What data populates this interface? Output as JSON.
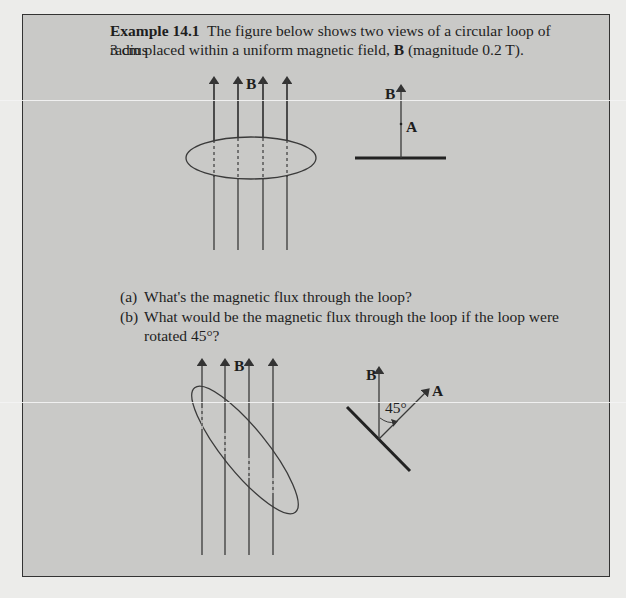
{
  "example": {
    "label": "Example 14.1",
    "intro_line1": "The figure below shows two views of a circular loop of radius",
    "intro_line2_a": "3 cm placed within a uniform magnetic field, ",
    "intro_line2_b": "B",
    "intro_line2_c": " (magnitude 0.2 T)."
  },
  "figure1": {
    "field_label": "B",
    "side_field_label": "B",
    "area_label": "A"
  },
  "questions": [
    {
      "marker": "(a)",
      "text": "What's the magnetic flux through the loop?"
    },
    {
      "marker": "(b)",
      "text": "What would be the magnetic flux through the loop if the loop were",
      "text2": "rotated 45°?"
    }
  ],
  "figure2": {
    "field_label": "B",
    "side_field_label": "B",
    "area_label": "A",
    "angle_label": "45°"
  },
  "colors": {
    "box_bg": "#c9c9c7",
    "page_bg": "#ececea",
    "line": "#3a3a3a"
  }
}
